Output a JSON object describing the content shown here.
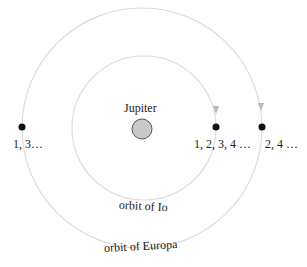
{
  "diagram": {
    "central_body": {
      "label": "Jupiter",
      "fill": "#c8c8c8",
      "stroke": "#555555"
    },
    "orbits": [
      {
        "name": "Io",
        "label": "orbit of Io",
        "color": "#d8d8d8"
      },
      {
        "name": "Europa",
        "label": "orbit of Europa",
        "color": "#d8d8d8"
      }
    ],
    "positions": [
      {
        "label": "1, 3…",
        "dot_color": "#111111"
      },
      {
        "label": "1, 2, 3, 4 …",
        "dot_color": "#111111"
      },
      {
        "label": "2, 4 …",
        "dot_color": "#111111"
      }
    ],
    "arrow_color": "#b0b0b0"
  }
}
